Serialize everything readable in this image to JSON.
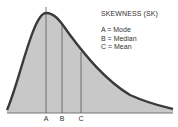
{
  "title": "SKEWNESS (SK)",
  "legend": [
    {
      "key": "A",
      "text": "A = Mode"
    },
    {
      "key": "B",
      "text": "B = Median"
    },
    {
      "key": "C",
      "text": "C = Mean"
    }
  ],
  "markers": [
    {
      "label": "A",
      "meaning": "Mode"
    },
    {
      "label": "B",
      "meaning": "Median"
    },
    {
      "label": "C",
      "meaning": "Mean"
    }
  ],
  "colors": {
    "fill": "#c8c8c8",
    "curve": "#3a3a3a",
    "line": "#555555",
    "text": "#333333"
  }
}
